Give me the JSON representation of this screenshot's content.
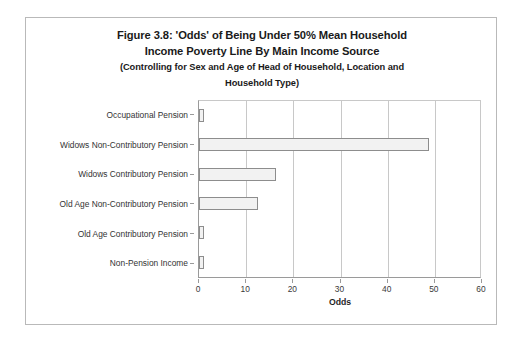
{
  "figure": {
    "title_lines": [
      "Figure 3.8: 'Odds' of Being Under 50% Mean Household",
      "Income Poverty Line By Main Income Source"
    ],
    "subtitle_lines": [
      "(Controlling for Sex and Age of Head of Household, Location and",
      "Household Type)"
    ],
    "border_color": "#b9b9b9"
  },
  "chart_data": {
    "type": "bar",
    "orientation": "horizontal",
    "title": "Figure 3.8: 'Odds' of Being Under 50% Mean Household Income Poverty Line By Main Income Source (Controlling for Sex and Age of Head of Household, Location and Household Type)",
    "xlabel": "Odds",
    "ylabel": "",
    "categories": [
      "Occupational Pension",
      "Widows Non-Contributory Pension",
      "Widows Contributory Pension",
      "Old Age Non-Contributory Pension",
      "Old Age Contributory Pension",
      "Non-Pension Income"
    ],
    "values": [
      1.0,
      48.7,
      16.4,
      12.5,
      1.0,
      1.0
    ],
    "xlim": [
      0,
      60
    ],
    "xticks": [
      0,
      10,
      20,
      30,
      40,
      50,
      60
    ],
    "grid": "vertical",
    "legend": "none",
    "bar_fill_color": "#f2f2f2",
    "bar_border_color": "#8d8d8d"
  }
}
